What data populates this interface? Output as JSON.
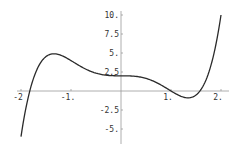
{
  "chart_data": {
    "type": "line",
    "title": "",
    "xlabel": "",
    "ylabel": "",
    "function": "x^5 - 3x^3 + 2",
    "xlim": [
      -2,
      2
    ],
    "ylim": [
      -6,
      10
    ],
    "grid": false,
    "legend": null,
    "x_ticks": [
      {
        "value": -2,
        "label": "-2"
      },
      {
        "value": -1,
        "label": "-1."
      },
      {
        "value": 1,
        "label": "1."
      },
      {
        "value": 2,
        "label": "2."
      }
    ],
    "y_ticks": [
      {
        "value": 10,
        "label": "10."
      },
      {
        "value": 7.5,
        "label": "7.5"
      },
      {
        "value": 5,
        "label": "5."
      },
      {
        "value": 2.5,
        "label": "2.5"
      },
      {
        "value": -2.5,
        "label": "-2.5"
      },
      {
        "value": -5,
        "label": "-5."
      }
    ],
    "series": [
      {
        "name": "f(x)",
        "x": [
          -2.0,
          -1.75,
          -1.5,
          -1.342,
          -1.25,
          -1.0,
          -0.75,
          -0.5,
          -0.25,
          0.0,
          0.25,
          0.5,
          0.75,
          1.0,
          1.25,
          1.342,
          1.5,
          1.75,
          2.0
        ],
        "y": [
          -6.0,
          0.99,
          4.53,
          4.93,
          4.81,
          4.0,
          3.03,
          2.34,
          2.05,
          2.0,
          1.95,
          1.66,
          0.97,
          0.0,
          -0.81,
          -0.93,
          -0.53,
          3.01,
          10.0
        ]
      }
    ],
    "colors": {
      "curve": "#2a2a2a",
      "axis": "#9a9a9a",
      "label": "#333333"
    }
  }
}
